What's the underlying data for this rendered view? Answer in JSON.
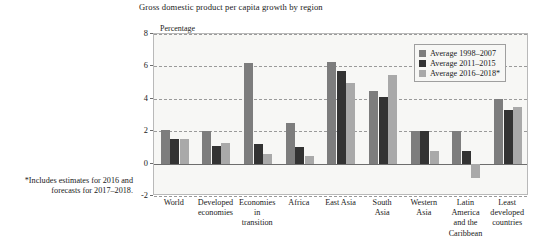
{
  "chart_data": {
    "type": "bar",
    "title": "Gross domestic product per capita growth by region",
    "ylabel": "Percentage",
    "xlabel": "",
    "ylim": [
      -2,
      8
    ],
    "yticks": [
      -2,
      0,
      2,
      4,
      6,
      8
    ],
    "grid": true,
    "legend_position": "top-right",
    "categories": [
      "World",
      "Developed economies",
      "Economies in transition",
      "Africa",
      "East Asia",
      "South Asia",
      "Western Asia",
      "Latin America and the Caribbean",
      "Least developed countries"
    ],
    "category_lines": [
      [
        "World"
      ],
      [
        "Developed",
        "economies"
      ],
      [
        "Economies",
        "in",
        "transition"
      ],
      [
        "Africa"
      ],
      [
        "East Asia"
      ],
      [
        "South",
        "Asia"
      ],
      [
        "Western",
        "Asia"
      ],
      [
        "Latin",
        "America",
        "and the",
        "Caribbean"
      ],
      [
        "Least",
        "developed",
        "countries"
      ]
    ],
    "series": [
      {
        "name": "Average 1998–2007",
        "color": "#7d7d7d",
        "values": [
          2.1,
          2.0,
          6.2,
          2.5,
          6.3,
          4.5,
          2.0,
          2.0,
          4.0
        ]
      },
      {
        "name": "Average 2011–2015",
        "color": "#333333",
        "values": [
          1.5,
          1.1,
          1.2,
          1.0,
          5.7,
          4.1,
          2.0,
          0.8,
          3.3
        ]
      },
      {
        "name": "Average 2016–2018*",
        "color": "#a9a9a9",
        "values": [
          1.5,
          1.3,
          0.6,
          0.5,
          5.0,
          5.5,
          0.8,
          -0.9,
          3.5
        ]
      }
    ],
    "footnote": "*Includes estimates for 2016 and forecasts for 2017–2018.",
    "footnote_lines": [
      "*Includes estimates for 2016 and",
      "forecasts for 2017–2018."
    ]
  }
}
